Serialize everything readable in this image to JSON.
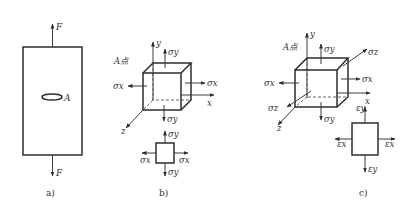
{
  "figure": {
    "panels": [
      {
        "id": "a",
        "caption": "a)",
        "force_top_label": "F",
        "force_bottom_label": "F",
        "point_label": "A"
      },
      {
        "id": "b",
        "caption": "b)",
        "point_label": "A点",
        "axes": {
          "x": "x",
          "y": "y",
          "z": "z"
        },
        "cube_stresses": {
          "sigma_y_top": "σy",
          "sigma_y_bottom": "σy",
          "sigma_x_left": "σx",
          "sigma_x_right": "σx"
        },
        "element_stresses": {
          "sigma_y_top": "σy",
          "sigma_y_bottom": "σy",
          "sigma_x_left": "σx",
          "sigma_x_right": "σx"
        }
      },
      {
        "id": "c",
        "caption": "c)",
        "point_label": "A点",
        "axes": {
          "x": "x",
          "y": "y",
          "z": "z"
        },
        "cube_stresses": {
          "sigma_y_top": "σy",
          "sigma_y_bottom": "σy",
          "sigma_x_left": "σx",
          "sigma_x_right": "σx",
          "sigma_z_back": "σz",
          "sigma_z_front": "σz"
        },
        "element_strains": {
          "eps_y_top": "εy",
          "eps_y_bottom": "εy",
          "eps_x_left": "εx",
          "eps_x_right": "εx"
        }
      }
    ]
  }
}
